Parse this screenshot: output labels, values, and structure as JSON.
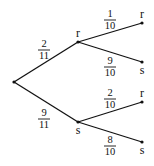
{
  "diagram": {
    "type": "probability-tree",
    "root": {
      "x": 14,
      "y": 82
    },
    "level1": [
      {
        "id": "r1",
        "label": "r",
        "x": 78,
        "y": 42,
        "prob": {
          "num": "2",
          "den": "11"
        }
      },
      {
        "id": "s1",
        "label": "s",
        "x": 78,
        "y": 122,
        "prob": {
          "num": "9",
          "den": "11"
        }
      }
    ],
    "level2": [
      {
        "parent": "r1",
        "label": "r",
        "x": 142,
        "y": 23,
        "prob": {
          "num": "1",
          "den": "10"
        }
      },
      {
        "parent": "r1",
        "label": "s",
        "x": 142,
        "y": 62,
        "prob": {
          "num": "9",
          "den": "10"
        }
      },
      {
        "parent": "s1",
        "label": "r",
        "x": 142,
        "y": 102,
        "prob": {
          "num": "2",
          "den": "10"
        }
      },
      {
        "parent": "s1",
        "label": "s",
        "x": 142,
        "y": 142,
        "prob": {
          "num": "8",
          "den": "10"
        }
      }
    ]
  }
}
